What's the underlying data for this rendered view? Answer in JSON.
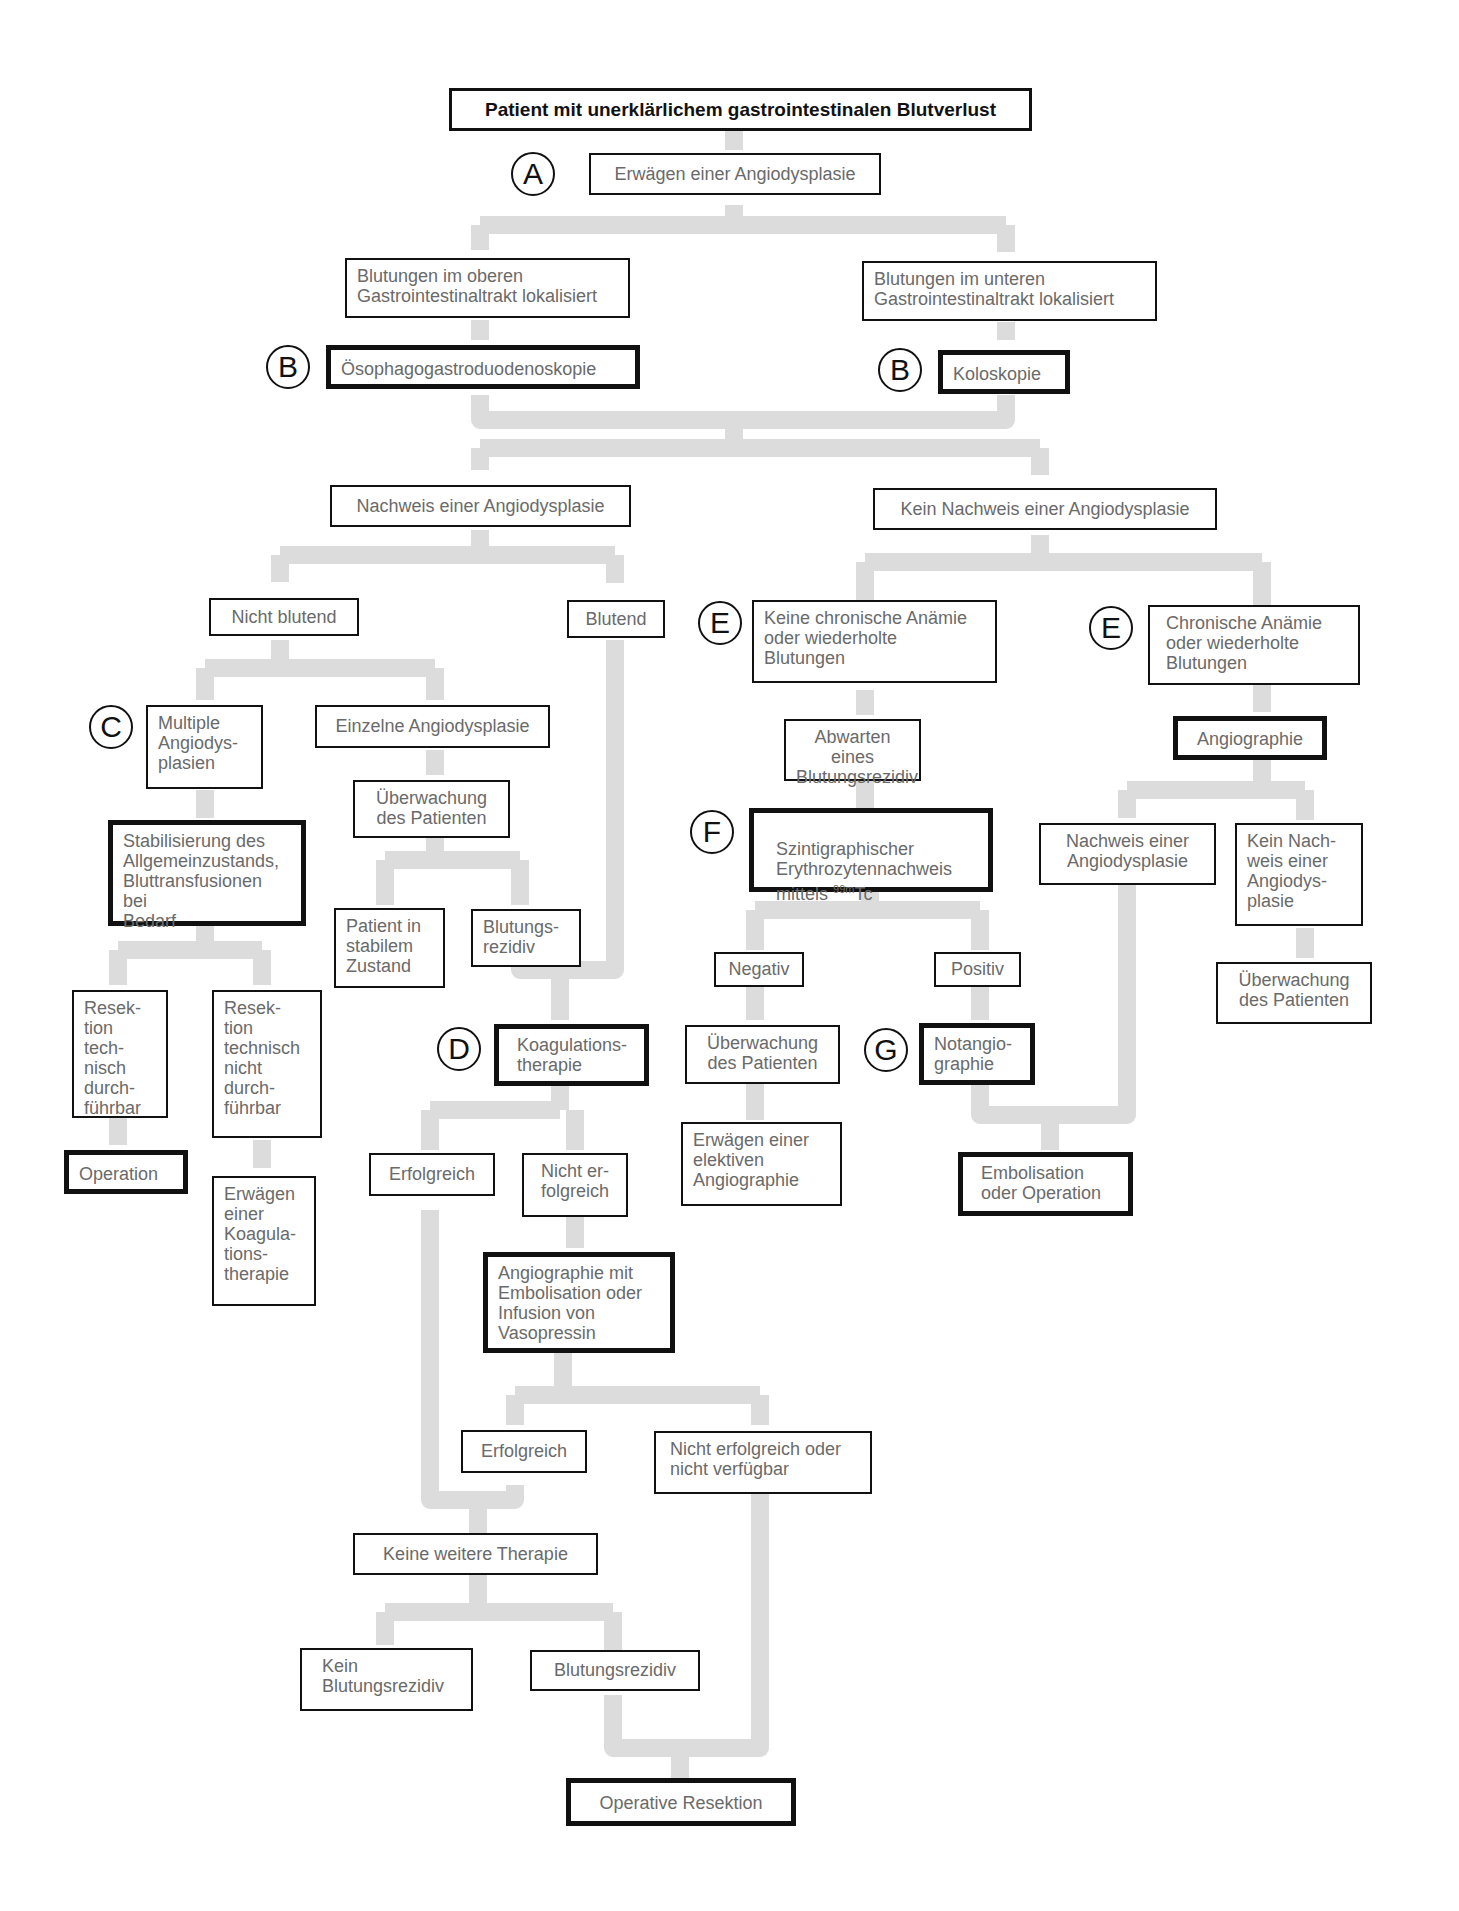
{
  "diagram": {
    "title": "Patient mit  unerklärlichem gastrointestinalen Blutverlust",
    "connector_color": "#dcdcdc",
    "border_color": "#111111",
    "text_color": "#6a6a6a",
    "badges": [
      {
        "id": "A",
        "label": "A"
      },
      {
        "id": "B1",
        "label": "B"
      },
      {
        "id": "B2",
        "label": "B"
      },
      {
        "id": "C",
        "label": "C"
      },
      {
        "id": "D",
        "label": "D"
      },
      {
        "id": "E1",
        "label": "E"
      },
      {
        "id": "E2",
        "label": "E"
      },
      {
        "id": "F",
        "label": "F"
      },
      {
        "id": "G",
        "label": "G"
      }
    ],
    "nodes": {
      "erwaegen": "Erwägen einer Angiodysplasie",
      "oben": "Blutungen im oberen\nGastrointestinaltrakt lokalisiert",
      "unten": "Blutungen im unteren\nGastrointestinaltrakt lokalisiert",
      "oegd": "Ösophagogastroduodenoskopie",
      "kolo": "Koloskopie",
      "nachweis": "Nachweis einer Angiodysplasie",
      "kein_nachweis": "Kein Nachweis einer Angiodysplasie",
      "nicht_blutend": "Nicht blutend",
      "blutend": "Blutend",
      "multiple": "Multiple\nAngiodys-\nplasien",
      "einzelne": "Einzelne Angiodysplasie",
      "stabil": "Stabilisierung des\nAllgemeinzustands,\nBluttransfusionen bei\nBedarf",
      "ueberw1": "Überwachung\ndes Patienten",
      "stabiler_zustand": "Patient in\nstabilem\nZustand",
      "rezidiv1": "Blutungs-\nrezidiv",
      "resek_ok": "Resek-\ntion tech-\nnisch\ndurch-\nführbar",
      "resek_nok": "Resek-\ntion\ntechnisch\nnicht\ndurch-\nführbar",
      "operation": "Operation",
      "erw_koag": "Erwägen\neiner\nKoagula-\ntions-\ntherapie",
      "koag": "Koagulations-\ntherapie",
      "erfolg1": "Erfolgreich",
      "nicht_erfolg1": "Nicht er-\nfolgreich",
      "angio_embo": "Angiographie mit\nEmbolisation oder\nInfusion von\nVasopressin",
      "erfolg2": "Erfolgreich",
      "nicht_erfolg2": "Nicht erfolgreich oder\nnicht verfügbar",
      "keine_therapie": "Keine weitere Therapie",
      "kein_rezidiv": "Kein\nBlutungsrezidiv",
      "rezidiv2": "Blutungsrezidiv",
      "op_resektion": "Operative Resektion",
      "keine_anaemie": "Keine chronische Anämie\noder wiederholte\nBlutungen",
      "chron_anaemie": "Chronische Anämie\noder wiederholte\nBlutungen",
      "abwarten": "Abwarten eines\nBlutungsrezidiv",
      "angiographie": "Angiographie",
      "szinti_main": "Szintigraphischer\nErythrozytennachweis\nmittels ",
      "szinti_sup": "99m",
      "szinti_tail": "Tc",
      "nachweis2": "Nachweis einer\nAngiodysplasie",
      "kein_nachweis2": "Kein Nach-\nweis einer\nAngiodys-\nplasie",
      "ueberw3": "Überwachung\ndes Patienten",
      "negativ": "Negativ",
      "positiv": "Positiv",
      "ueberw2": "Überwachung\ndes Patienten",
      "notangio": "Notangio-\ngraphie",
      "elektiv": "Erwägen einer\nelektiven\nAngiographie",
      "embo_op": "Embolisation\noder Operation"
    }
  }
}
